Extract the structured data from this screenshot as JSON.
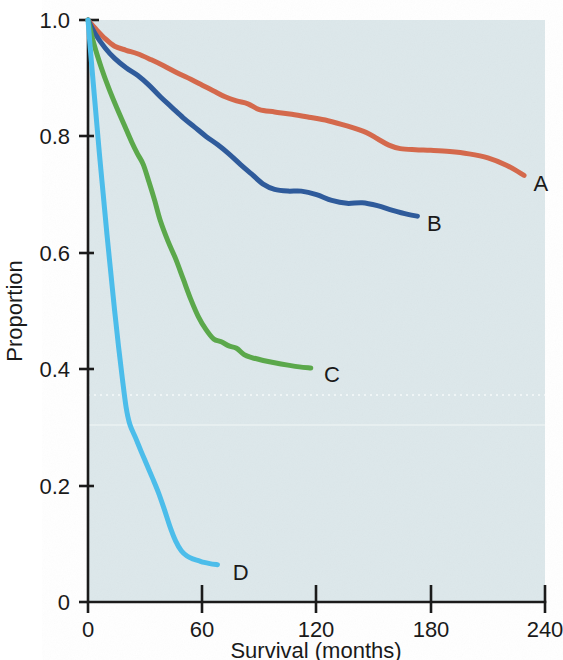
{
  "chart_data": {
    "type": "line",
    "title": "",
    "subtitle": "",
    "xlabel": "Survival (months)",
    "ylabel": "Proportion",
    "xlim": [
      0,
      240
    ],
    "ylim": [
      0,
      1.0
    ],
    "xticks": [
      0,
      60,
      120,
      180,
      240
    ],
    "xticklabels": [
      "0",
      "60",
      "120",
      "180",
      "240"
    ],
    "yticks": [
      0,
      0.2,
      0.4,
      0.6,
      0.8,
      1.0
    ],
    "yticklabels": [
      "0",
      "0.2",
      "0.4",
      "0.6",
      "0.8",
      "1.0"
    ],
    "grid": false,
    "legend_position": "line-end-labels",
    "background_color": "#dde8eb",
    "series": [
      {
        "name": "A",
        "label": "A",
        "color": "#d4694c",
        "end_label_x": 229,
        "end_label_y": 0.73,
        "x": [
          0,
          4,
          9,
          14,
          20,
          26,
          33,
          40,
          47,
          54,
          60,
          66,
          72,
          78,
          84,
          90,
          98,
          107,
          116,
          126,
          136,
          146,
          152,
          158,
          164,
          172,
          180,
          190,
          200,
          210,
          220,
          229
        ],
        "y": [
          1.0,
          0.985,
          0.968,
          0.955,
          0.948,
          0.942,
          0.932,
          0.921,
          0.909,
          0.898,
          0.888,
          0.878,
          0.868,
          0.861,
          0.856,
          0.846,
          0.842,
          0.838,
          0.833,
          0.827,
          0.818,
          0.807,
          0.796,
          0.785,
          0.779,
          0.777,
          0.776,
          0.774,
          0.77,
          0.763,
          0.75,
          0.733
        ]
      },
      {
        "name": "B",
        "label": "B",
        "color": "#2f5b9b",
        "end_label_x": 173,
        "end_label_y": 0.663,
        "x": [
          0,
          4,
          9,
          14,
          20,
          26,
          32,
          38,
          44,
          50,
          56,
          62,
          68,
          74,
          80,
          86,
          92,
          98,
          105,
          112,
          120,
          128,
          136,
          144,
          152,
          160,
          168,
          173
        ],
        "y": [
          1.0,
          0.975,
          0.952,
          0.934,
          0.918,
          0.905,
          0.888,
          0.868,
          0.85,
          0.832,
          0.816,
          0.8,
          0.786,
          0.77,
          0.752,
          0.735,
          0.718,
          0.709,
          0.706,
          0.706,
          0.7,
          0.69,
          0.685,
          0.686,
          0.681,
          0.673,
          0.666,
          0.663
        ]
      },
      {
        "name": "C",
        "label": "C",
        "color": "#5ba84b",
        "end_label_x": 117,
        "end_label_y": 0.402,
        "x": [
          0,
          3,
          7,
          11,
          15,
          19,
          23,
          26,
          29,
          32,
          35,
          38,
          42,
          46,
          50,
          54,
          58,
          62,
          66,
          70,
          74,
          78,
          82,
          86,
          92,
          98,
          105,
          111,
          117
        ],
        "y": [
          1.0,
          0.96,
          0.918,
          0.882,
          0.85,
          0.82,
          0.79,
          0.77,
          0.752,
          0.722,
          0.69,
          0.655,
          0.62,
          0.59,
          0.555,
          0.52,
          0.49,
          0.468,
          0.452,
          0.447,
          0.44,
          0.436,
          0.425,
          0.42,
          0.415,
          0.411,
          0.407,
          0.404,
          0.402
        ]
      },
      {
        "name": "D",
        "label": "D",
        "color": "#4cbdea",
        "end_label_x": 68,
        "end_label_y": 0.064,
        "x": [
          0,
          2,
          4,
          6,
          8,
          10,
          12,
          14,
          16,
          18,
          20,
          22,
          25,
          28,
          31,
          34,
          37,
          40,
          43,
          46,
          49,
          52,
          55,
          58,
          61,
          64,
          68
        ],
        "y": [
          1.0,
          0.92,
          0.845,
          0.77,
          0.7,
          0.63,
          0.565,
          0.5,
          0.44,
          0.385,
          0.335,
          0.305,
          0.282,
          0.258,
          0.235,
          0.212,
          0.188,
          0.16,
          0.13,
          0.105,
          0.088,
          0.079,
          0.074,
          0.071,
          0.068,
          0.066,
          0.064
        ]
      }
    ],
    "annotations": [
      {
        "text": "A",
        "x": 234,
        "y": 0.72
      },
      {
        "text": "B",
        "x": 178,
        "y": 0.652
      },
      {
        "text": "C",
        "x": 124,
        "y": 0.392
      },
      {
        "text": "D",
        "x": 76,
        "y": 0.052
      }
    ]
  }
}
